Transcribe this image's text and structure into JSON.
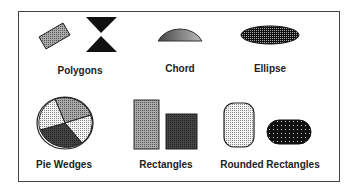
{
  "labels": {
    "polygons": "Polygons",
    "chord": "Chord",
    "ellipse": "Ellipse",
    "pie_wedges": "Pie Wedges",
    "rectangles": "Rectangles",
    "rounded_rectangles": "Rounded Rectangles"
  },
  "colors": {
    "border": "#444444",
    "dark_fill": "#111111",
    "mid_gray": "#888888",
    "light_gray": "#cccccc",
    "dark_gray": "#555555"
  }
}
